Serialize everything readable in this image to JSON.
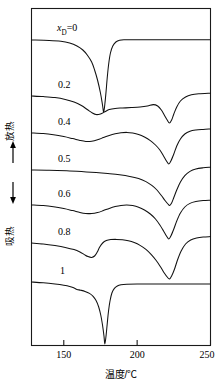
{
  "chart_data": {
    "type": "line",
    "title": "",
    "xlabel": "温度/℃",
    "ylabel_up": "放热",
    "ylabel_down": "吸热",
    "xlim": [
      128,
      250
    ],
    "xticks": [
      150,
      200,
      250
    ],
    "xticklabels": [
      "150",
      "200",
      "250"
    ],
    "grid": false,
    "legend": "inline curve labels at left of each trace",
    "axis_arrow_up": "↑",
    "axis_arrow_down": "↓",
    "series": [
      {
        "name": "xD=0",
        "label": "x_D=0",
        "label_prefix": "x",
        "label_sub": "D",
        "label_suffix": "=0",
        "baseline_y": 40,
        "features": "flat baseline, broad onset from 150 °C, single very deep sharp endotherm at 177 °C, sharp recovery, flat to 250 °C",
        "peaks": [
          {
            "temp": 177,
            "type": "endotherm",
            "depth": "very deep"
          }
        ],
        "points": [
          [
            128,
            40
          ],
          [
            140,
            40.4
          ],
          [
            148,
            41.2
          ],
          [
            154,
            43
          ],
          [
            159,
            46
          ],
          [
            163,
            50
          ],
          [
            166,
            55
          ],
          [
            169,
            62
          ],
          [
            171,
            70
          ],
          [
            173,
            80
          ],
          [
            175,
            93
          ],
          [
            176.4,
            105
          ],
          [
            177.2,
            112
          ],
          [
            178,
            104
          ],
          [
            178.8,
            92
          ],
          [
            179.6,
            78
          ],
          [
            180.6,
            64
          ],
          [
            181.8,
            53
          ],
          [
            183.4,
            46
          ],
          [
            185.5,
            42
          ],
          [
            188,
            40.2
          ],
          [
            192,
            39.8
          ],
          [
            200,
            39.7
          ],
          [
            215,
            39.7
          ],
          [
            235,
            39.7
          ],
          [
            250,
            39.7
          ]
        ]
      },
      {
        "name": "xD=0.2",
        "label": "0.2",
        "baseline_y": 96,
        "features": "broad shallow endotherm near 170 °C, broad second endotherm at 222 °C",
        "peaks": [
          {
            "temp": 170,
            "type": "endotherm",
            "depth": "shallow broad"
          },
          {
            "temp": 222,
            "type": "endotherm",
            "depth": "medium"
          }
        ],
        "points": [
          [
            128,
            96
          ],
          [
            136,
            96.6
          ],
          [
            144,
            97.6
          ],
          [
            151,
            99.4
          ],
          [
            157,
            102
          ],
          [
            162,
            105.5
          ],
          [
            166,
            109.5
          ],
          [
            169.5,
            113
          ],
          [
            172,
            114.6
          ],
          [
            175,
            114
          ],
          [
            178,
            111.8
          ],
          [
            181,
            109.6
          ],
          [
            185,
            108.4
          ],
          [
            190,
            108
          ],
          [
            196,
            107.6
          ],
          [
            202,
            107
          ],
          [
            207,
            106
          ],
          [
            211,
            104.6
          ],
          [
            214,
            106
          ],
          [
            216.5,
            110
          ],
          [
            218.5,
            115
          ],
          [
            220.5,
            120
          ],
          [
            222,
            123
          ],
          [
            223.5,
            120
          ],
          [
            225,
            114
          ],
          [
            227,
            107
          ],
          [
            229.5,
            101
          ],
          [
            233,
            97
          ],
          [
            237,
            94.8
          ],
          [
            242,
            93.8
          ],
          [
            250,
            93.2
          ]
        ]
      },
      {
        "name": "xD=0.4",
        "label": "0.4",
        "baseline_y": 133,
        "features": "shallow broad endotherm near 165 °C, small exothermic hump near 193 °C, sharp deep endotherm at 222 °C",
        "peaks": [
          {
            "temp": 165,
            "type": "endotherm",
            "depth": "shallow"
          },
          {
            "temp": 222,
            "type": "endotherm",
            "depth": "deep"
          }
        ],
        "points": [
          [
            128,
            133
          ],
          [
            136,
            133.6
          ],
          [
            143,
            134.8
          ],
          [
            150,
            136.6
          ],
          [
            156,
            138.6
          ],
          [
            161,
            140.4
          ],
          [
            165,
            141.4
          ],
          [
            169,
            141.2
          ],
          [
            173,
            139.8
          ],
          [
            177,
            137.6
          ],
          [
            181,
            135.4
          ],
          [
            185,
            133.8
          ],
          [
            189,
            132.8
          ],
          [
            193,
            132.4
          ],
          [
            197,
            133
          ],
          [
            201,
            134.4
          ],
          [
            205,
            137
          ],
          [
            209,
            140.6
          ],
          [
            212.5,
            145
          ],
          [
            215.5,
            150
          ],
          [
            218,
            156
          ],
          [
            220,
            161
          ],
          [
            221.6,
            164
          ],
          [
            223,
            161
          ],
          [
            225,
            154
          ],
          [
            227,
            146
          ],
          [
            229.5,
            139
          ],
          [
            232.5,
            134
          ],
          [
            236,
            131.2
          ],
          [
            240,
            130
          ],
          [
            245,
            129.4
          ],
          [
            250,
            129
          ]
        ]
      },
      {
        "name": "xD=0.5",
        "label": "0.5",
        "baseline_y": 170,
        "features": "nearly flat baseline, single deep sharp endotherm at 222 °C",
        "peaks": [
          {
            "temp": 222,
            "type": "endotherm",
            "depth": "deep"
          }
        ],
        "points": [
          [
            128,
            170
          ],
          [
            140,
            170.2
          ],
          [
            152,
            170.8
          ],
          [
            162,
            171.6
          ],
          [
            172,
            172.6
          ],
          [
            180,
            173.6
          ],
          [
            188,
            174.8
          ],
          [
            195,
            176.4
          ],
          [
            201,
            178.6
          ],
          [
            206,
            181.6
          ],
          [
            210,
            185.4
          ],
          [
            213.5,
            190
          ],
          [
            216.5,
            195.5
          ],
          [
            219,
            200.5
          ],
          [
            221,
            204
          ],
          [
            222.2,
            205.4
          ],
          [
            223.5,
            203
          ],
          [
            225,
            197.5
          ],
          [
            227,
            190
          ],
          [
            229.5,
            182
          ],
          [
            232.5,
            175.6
          ],
          [
            236,
            171.4
          ],
          [
            240,
            169
          ],
          [
            245,
            167.8
          ],
          [
            250,
            167.2
          ]
        ]
      },
      {
        "name": "xD=0.6",
        "label": "0.6",
        "baseline_y": 205,
        "features": "shallow wave with minimum near 168 °C and hump near 193 °C, sharp deep endotherm at 222 °C",
        "peaks": [
          {
            "temp": 168,
            "type": "endotherm",
            "depth": "shallow"
          },
          {
            "temp": 222,
            "type": "endotherm",
            "depth": "deep"
          }
        ],
        "points": [
          [
            128,
            205
          ],
          [
            136,
            205.6
          ],
          [
            143,
            206.8
          ],
          [
            150,
            208.6
          ],
          [
            156,
            210.6
          ],
          [
            161,
            212.4
          ],
          [
            165,
            213.4
          ],
          [
            169,
            213.6
          ],
          [
            173,
            212.6
          ],
          [
            177,
            210.6
          ],
          [
            181,
            208.4
          ],
          [
            185,
            206.6
          ],
          [
            189,
            205.4
          ],
          [
            193,
            205
          ],
          [
            197,
            205.6
          ],
          [
            201,
            207.2
          ],
          [
            205,
            210
          ],
          [
            209,
            214
          ],
          [
            212.5,
            219
          ],
          [
            215.5,
            225
          ],
          [
            218,
            231
          ],
          [
            220,
            236
          ],
          [
            221.6,
            239
          ],
          [
            223,
            236
          ],
          [
            225,
            229
          ],
          [
            227,
            221
          ],
          [
            229.5,
            213
          ],
          [
            232.5,
            207
          ],
          [
            236,
            203.4
          ],
          [
            240,
            201.6
          ],
          [
            245,
            200.6
          ],
          [
            250,
            200.2
          ]
        ]
      },
      {
        "name": "xD=0.8",
        "label": "0.8",
        "baseline_y": 243,
        "features": "distinct endotherm at 168 °C, rise to plateau near 190 °C, very deep sharp endotherm at 222 °C",
        "peaks": [
          {
            "temp": 168,
            "type": "endotherm",
            "depth": "medium"
          },
          {
            "temp": 222,
            "type": "endotherm",
            "depth": "very deep"
          }
        ],
        "points": [
          [
            128,
            243
          ],
          [
            136,
            244
          ],
          [
            144,
            245.6
          ],
          [
            151,
            247.4
          ],
          [
            157,
            249.6
          ],
          [
            161,
            252
          ],
          [
            164,
            254.6
          ],
          [
            166.5,
            256.6
          ],
          [
            169,
            257.4
          ],
          [
            171,
            256
          ],
          [
            172.8,
            252
          ],
          [
            174.5,
            247
          ],
          [
            176.5,
            243
          ],
          [
            179,
            240.6
          ],
          [
            182,
            239.6
          ],
          [
            186,
            239.4
          ],
          [
            190,
            239.8
          ],
          [
            194,
            240.8
          ],
          [
            198,
            242.6
          ],
          [
            202,
            245.4
          ],
          [
            206,
            249.4
          ],
          [
            209.5,
            254.4
          ],
          [
            213,
            260.5
          ],
          [
            216,
            267
          ],
          [
            218.5,
            273
          ],
          [
            220.5,
            277
          ],
          [
            222,
            279
          ],
          [
            223.5,
            276
          ],
          [
            225.5,
            269
          ],
          [
            227.5,
            260
          ],
          [
            230,
            251
          ],
          [
            233,
            244
          ],
          [
            236.5,
            240
          ],
          [
            240.5,
            238
          ],
          [
            245,
            237
          ],
          [
            250,
            236.6
          ]
        ]
      },
      {
        "name": "xD=1",
        "label": "1",
        "baseline_y": 282,
        "features": "flat baseline with small shoulder at 158 °C, extremely deep narrow endotherm at 178 °C, sharp recovery, flat to 250 °C",
        "peaks": [
          {
            "temp": 178,
            "type": "endotherm",
            "depth": "extremely deep"
          }
        ],
        "points": [
          [
            128,
            282
          ],
          [
            136,
            282.8
          ],
          [
            144,
            284
          ],
          [
            150,
            285.2
          ],
          [
            154,
            286.4
          ],
          [
            157,
            288
          ],
          [
            159,
            289.4
          ],
          [
            161.5,
            290.2
          ],
          [
            164.5,
            291.4
          ],
          [
            167.5,
            293.4
          ],
          [
            170,
            296.4
          ],
          [
            172,
            300.6
          ],
          [
            173.8,
            307
          ],
          [
            175.2,
            315
          ],
          [
            176.4,
            325
          ],
          [
            177.4,
            336
          ],
          [
            178,
            344
          ],
          [
            178.8,
            336
          ],
          [
            179.6,
            324
          ],
          [
            180.5,
            311
          ],
          [
            181.5,
            301
          ],
          [
            182.8,
            293
          ],
          [
            184.5,
            288.4
          ],
          [
            186.5,
            286
          ],
          [
            189,
            284.8
          ],
          [
            193,
            284.2
          ],
          [
            200,
            284
          ],
          [
            215,
            284
          ],
          [
            235,
            284
          ],
          [
            250,
            284
          ]
        ]
      }
    ],
    "curve_label_positions": [
      {
        "label_id": "xD=0",
        "x": 57,
        "y": 31
      },
      {
        "label_id": "0.2",
        "x": 58,
        "y": 88
      },
      {
        "label_id": "0.4",
        "x": 58,
        "y": 125
      },
      {
        "label_id": "0.5",
        "x": 58,
        "y": 162
      },
      {
        "label_id": "0.6",
        "x": 58,
        "y": 197
      },
      {
        "label_id": "0.8",
        "x": 58,
        "y": 235
      },
      {
        "label_id": "1",
        "x": 60,
        "y": 274
      }
    ]
  }
}
